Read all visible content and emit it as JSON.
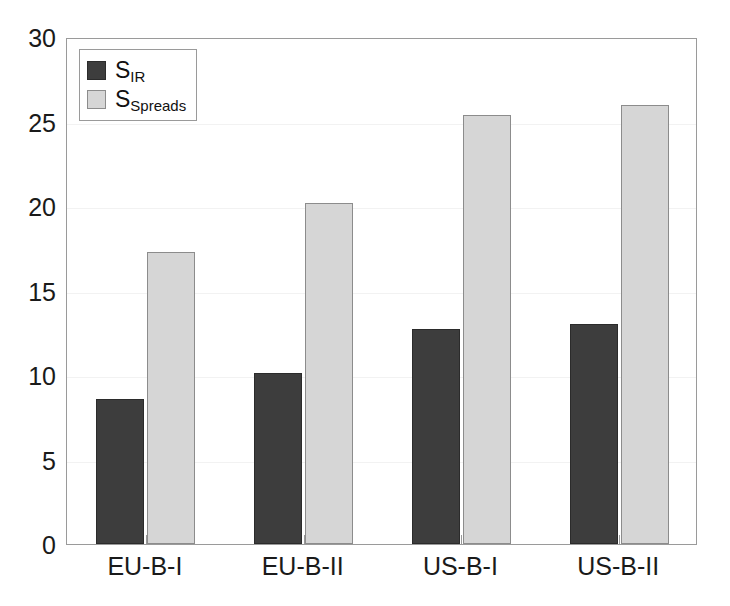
{
  "chart_data": {
    "type": "bar",
    "title": "",
    "xlabel": "",
    "ylabel": "",
    "categories": [
      "EU-B-I",
      "EU-B-II",
      "US-B-I",
      "US-B-II"
    ],
    "series": [
      {
        "name": "S_IR",
        "legend_label": "S",
        "legend_sub": "IR",
        "color": "#3d3d3d",
        "values": [
          8.6,
          10.1,
          12.7,
          13.0
        ]
      },
      {
        "name": "S_Spreads",
        "legend_label": "S",
        "legend_sub": "Spreads",
        "color": "#d6d6d6",
        "values": [
          17.3,
          20.2,
          25.4,
          26.0
        ]
      }
    ],
    "ylim": [
      0,
      30
    ],
    "yticks": [
      0,
      5,
      10,
      15,
      20,
      25,
      30
    ],
    "ytick_labels": [
      "0",
      "5",
      "10",
      "15",
      "20",
      "25",
      "30"
    ],
    "grid": false,
    "legend_position": "upper left",
    "axis_color": "#9a9a9a",
    "text_color": "#1a1a1a",
    "background": "#ffffff"
  }
}
